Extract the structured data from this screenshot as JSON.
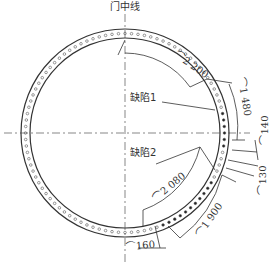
{
  "diagram": {
    "type": "flange-bolt-circle-defect-map",
    "centerline_label": "门中线",
    "defects": [
      {
        "id": 1,
        "label": "缺陷1"
      },
      {
        "id": 2,
        "label": "缺陷2"
      }
    ],
    "dimensions": [
      {
        "id": "arc_top",
        "value": "2 200",
        "prefix": "⌒"
      },
      {
        "id": "arc_right_upper",
        "value": "1 480",
        "prefix": "⌒"
      },
      {
        "id": "arc_right_small",
        "value": "140",
        "prefix": "⌒"
      },
      {
        "id": "arc_right_lower",
        "value": "130",
        "prefix": "⌒"
      },
      {
        "id": "arc_lower_inner",
        "value": "2 080",
        "prefix": "⌒"
      },
      {
        "id": "arc_lower_outer",
        "value": "1 900",
        "prefix": "⌒"
      },
      {
        "id": "arc_bottom",
        "value": "160",
        "prefix": "⌒"
      }
    ],
    "colors": {
      "line": "#333333",
      "background": "#ffffff"
    }
  }
}
